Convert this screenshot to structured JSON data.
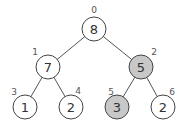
{
  "diagram": {
    "type": "binary-heap-tree",
    "colors": {
      "node_fill": "#ffffff",
      "highlight_fill": "#c8c8c8",
      "stroke": "#444444",
      "edge": "#555555"
    },
    "nodes": [
      {
        "index": "0",
        "value": "8",
        "x": 94,
        "y": 29,
        "highlighted": false,
        "ix": 94,
        "iy": 10
      },
      {
        "index": "1",
        "value": "7",
        "x": 48,
        "y": 67,
        "highlighted": false,
        "ix": 35,
        "iy": 52
      },
      {
        "index": "2",
        "value": "5",
        "x": 141,
        "y": 67,
        "highlighted": true,
        "ix": 154,
        "iy": 52
      },
      {
        "index": "3",
        "value": "1",
        "x": 25,
        "y": 107,
        "highlighted": false,
        "ix": 14,
        "iy": 92
      },
      {
        "index": "4",
        "value": "2",
        "x": 71,
        "y": 107,
        "highlighted": false,
        "ix": 78,
        "iy": 91
      },
      {
        "index": "5",
        "value": "3",
        "x": 117,
        "y": 107,
        "highlighted": true,
        "ix": 111,
        "iy": 92
      },
      {
        "index": "6",
        "value": "2",
        "x": 163,
        "y": 107,
        "highlighted": false,
        "ix": 172,
        "iy": 92
      }
    ],
    "edges": [
      {
        "from": "0",
        "to": "1"
      },
      {
        "from": "0",
        "to": "2"
      },
      {
        "from": "1",
        "to": "3"
      },
      {
        "from": "1",
        "to": "4"
      },
      {
        "from": "2",
        "to": "5"
      },
      {
        "from": "2",
        "to": "6"
      }
    ]
  }
}
